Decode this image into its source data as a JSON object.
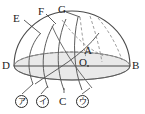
{
  "figure": {
    "kind": "celestial-hemisphere-diagram",
    "colors": {
      "stroke": "#3a3a3a",
      "stroke_light": "#8a8a8a",
      "horizon_fill": "#e9e9e9",
      "horizon_line": "#6e6e6e",
      "background": "#ffffff",
      "text": "#1b1b1b"
    },
    "labels": {
      "e": "E",
      "f": "F",
      "g": "G",
      "a": "A",
      "o": "O",
      "b": "B",
      "d": "D",
      "c": "C"
    },
    "circled_labels": [
      {
        "id": "marker-a",
        "text": "ア"
      },
      {
        "id": "marker-i",
        "text": "イ"
      },
      {
        "id": "marker-u",
        "text": "ウ"
      }
    ]
  }
}
